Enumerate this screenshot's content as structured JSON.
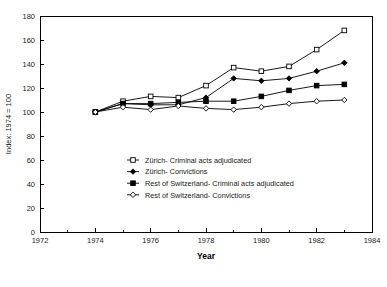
{
  "chart_data": {
    "type": "line",
    "title": "",
    "xlabel": "Year",
    "ylabel": "Index: 1974 = 100",
    "xlim": [
      1972,
      1984
    ],
    "ylim": [
      0,
      180
    ],
    "xticks": [
      1972,
      1974,
      1976,
      1978,
      1980,
      1982,
      1984
    ],
    "xminorticks": [
      1973,
      1975,
      1977,
      1979,
      1981,
      1983
    ],
    "yticks": [
      0,
      20,
      40,
      60,
      80,
      100,
      120,
      140,
      160,
      180
    ],
    "grid": false,
    "legend_position": "inside-lower-left",
    "x": [
      1974,
      1975,
      1976,
      1977,
      1978,
      1979,
      1980,
      1981,
      1982,
      1983
    ],
    "series": [
      {
        "name": "Zürich- Criminal acts adjudicated",
        "marker": "open-square",
        "values": [
          100,
          109,
          113,
          112,
          122,
          137,
          134,
          138,
          152,
          168
        ]
      },
      {
        "name": "Zürich- Convictions",
        "marker": "filled-diamond",
        "values": [
          100,
          107,
          106,
          106,
          112,
          128,
          126,
          128,
          134,
          141
        ]
      },
      {
        "name": "Rest of Switzerland- Criminal acts adjudicated",
        "marker": "filled-square",
        "values": [
          100,
          107,
          107,
          108,
          109,
          109,
          113,
          118,
          122,
          123
        ]
      },
      {
        "name": "Rest of Switzerland- Convictions",
        "marker": "open-diamond",
        "values": [
          100,
          104,
          102,
          105,
          103,
          102,
          104,
          107,
          109,
          110
        ]
      }
    ]
  },
  "axis": {
    "x_title": "Year",
    "y_title": "Index: 1974 = 100",
    "x_tick_labels": [
      "1972",
      "1974",
      "1976",
      "1978",
      "1980",
      "1982",
      "1984"
    ],
    "y_tick_labels": [
      "0",
      "20",
      "40",
      "60",
      "80",
      "100",
      "120",
      "140",
      "160",
      "180"
    ]
  },
  "legend": {
    "items": [
      {
        "label": "Zürich- Criminal acts adjudicated",
        "marker": "open-square"
      },
      {
        "label": "Zürich- Convictions",
        "marker": "filled-diamond"
      },
      {
        "label": "Rest of Switzerland- Criminal acts adjudicated",
        "marker": "filled-square"
      },
      {
        "label": "Rest of Switzerland- Convictions",
        "marker": "open-diamond"
      }
    ]
  },
  "colors": {
    "line": "#000000",
    "axis": "#000000",
    "text": "#1a1a1a",
    "background": "#ffffff"
  }
}
